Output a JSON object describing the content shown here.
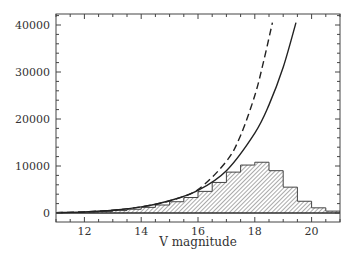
{
  "chart_data": {
    "type": "bar",
    "title": "",
    "xlabel": "V magnitude",
    "ylabel": "",
    "xlim": [
      11.0,
      21.0
    ],
    "ylim": [
      -1800,
      42000
    ],
    "x_ticks": [
      12,
      14,
      16,
      18,
      20
    ],
    "x_tick_labels": [
      "12",
      "14",
      "16",
      "18",
      "20"
    ],
    "y_ticks": [
      0,
      10000,
      20000,
      30000,
      40000
    ],
    "y_tick_labels": [
      "0",
      "10000",
      "20000",
      "30000",
      "40000"
    ],
    "grid": false,
    "legend": null,
    "histogram": {
      "name": "observed counts",
      "style": "hatched",
      "bin_width": 0.5,
      "bin_edges": [
        11.0,
        11.5,
        12.0,
        12.5,
        13.0,
        13.5,
        14.0,
        14.5,
        15.0,
        15.5,
        16.0,
        16.5,
        17.0,
        17.5,
        18.0,
        18.5,
        19.0,
        19.5,
        20.0,
        20.5,
        21.0
      ],
      "values": [
        60,
        120,
        200,
        330,
        520,
        800,
        1200,
        1700,
        2400,
        3300,
        4600,
        6500,
        8700,
        10200,
        10800,
        9000,
        5500,
        2500,
        1100,
        400
      ]
    },
    "series": [
      {
        "name": "model (solid)",
        "style": "solid",
        "x": [
          11.0,
          12.0,
          13.0,
          14.0,
          15.0,
          16.0,
          17.0,
          18.0,
          18.5,
          19.0,
          19.45
        ],
        "values": [
          80,
          250,
          600,
          1300,
          2600,
          4800,
          9000,
          17000,
          23000,
          31000,
          40500
        ]
      },
      {
        "name": "model (dashed)",
        "style": "dashed",
        "x": [
          11.0,
          12.0,
          13.0,
          14.0,
          15.0,
          16.0,
          17.0,
          17.5,
          18.0,
          18.3,
          18.62
        ],
        "values": [
          80,
          250,
          600,
          1300,
          2600,
          5000,
          11000,
          16500,
          25000,
          32000,
          40500
        ]
      }
    ]
  }
}
